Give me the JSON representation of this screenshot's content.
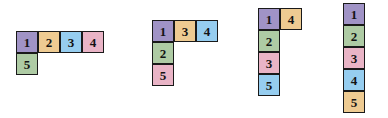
{
  "canvas": {
    "width": 388,
    "height": 118,
    "background": "#ffffff"
  },
  "style": {
    "cell_size": 22,
    "border_color": "#1a1a1a",
    "text_color": "#131313"
  },
  "palette": {
    "purple": "#a093c6",
    "green": "#aecba4",
    "pink": "#e9b4c6",
    "blue": "#96cdef",
    "tan": "#eecb92"
  },
  "shapes": [
    {
      "name": "shape-1",
      "x": 16,
      "y": 31,
      "cells": [
        {
          "label": "1",
          "col": 0,
          "row": 0,
          "color": "#a093c6",
          "color_name": "purple"
        },
        {
          "label": "2",
          "col": 1,
          "row": 0,
          "color": "#eecb92",
          "color_name": "tan"
        },
        {
          "label": "3",
          "col": 2,
          "row": 0,
          "color": "#96cdef",
          "color_name": "blue"
        },
        {
          "label": "4",
          "col": 3,
          "row": 0,
          "color": "#e9b4c6",
          "color_name": "pink"
        },
        {
          "label": "5",
          "col": 0,
          "row": 1,
          "color": "#aecba4",
          "color_name": "green"
        }
      ]
    },
    {
      "name": "shape-2",
      "x": 152,
      "y": 20,
      "cells": [
        {
          "label": "1",
          "col": 0,
          "row": 0,
          "color": "#a093c6",
          "color_name": "purple"
        },
        {
          "label": "3",
          "col": 1,
          "row": 0,
          "color": "#eecb92",
          "color_name": "tan"
        },
        {
          "label": "4",
          "col": 2,
          "row": 0,
          "color": "#96cdef",
          "color_name": "blue"
        },
        {
          "label": "2",
          "col": 0,
          "row": 1,
          "color": "#aecba4",
          "color_name": "green"
        },
        {
          "label": "5",
          "col": 0,
          "row": 2,
          "color": "#e9b4c6",
          "color_name": "pink"
        }
      ]
    },
    {
      "name": "shape-3",
      "x": 258,
      "y": 8,
      "cells": [
        {
          "label": "1",
          "col": 0,
          "row": 0,
          "color": "#a093c6",
          "color_name": "purple"
        },
        {
          "label": "4",
          "col": 1,
          "row": 0,
          "color": "#eecb92",
          "color_name": "tan"
        },
        {
          "label": "2",
          "col": 0,
          "row": 1,
          "color": "#aecba4",
          "color_name": "green"
        },
        {
          "label": "3",
          "col": 0,
          "row": 2,
          "color": "#e9b4c6",
          "color_name": "pink"
        },
        {
          "label": "5",
          "col": 0,
          "row": 3,
          "color": "#96cdef",
          "color_name": "blue"
        }
      ]
    },
    {
      "name": "shape-4",
      "x": 343,
      "y": 3,
      "cells": [
        {
          "label": "1",
          "col": 0,
          "row": 0,
          "color": "#a093c6",
          "color_name": "purple"
        },
        {
          "label": "2",
          "col": 0,
          "row": 1,
          "color": "#aecba4",
          "color_name": "green"
        },
        {
          "label": "3",
          "col": 0,
          "row": 2,
          "color": "#e9b4c6",
          "color_name": "pink"
        },
        {
          "label": "4",
          "col": 0,
          "row": 3,
          "color": "#96cdef",
          "color_name": "blue"
        },
        {
          "label": "5",
          "col": 0,
          "row": 4,
          "color": "#eecb92",
          "color_name": "tan"
        }
      ]
    }
  ]
}
